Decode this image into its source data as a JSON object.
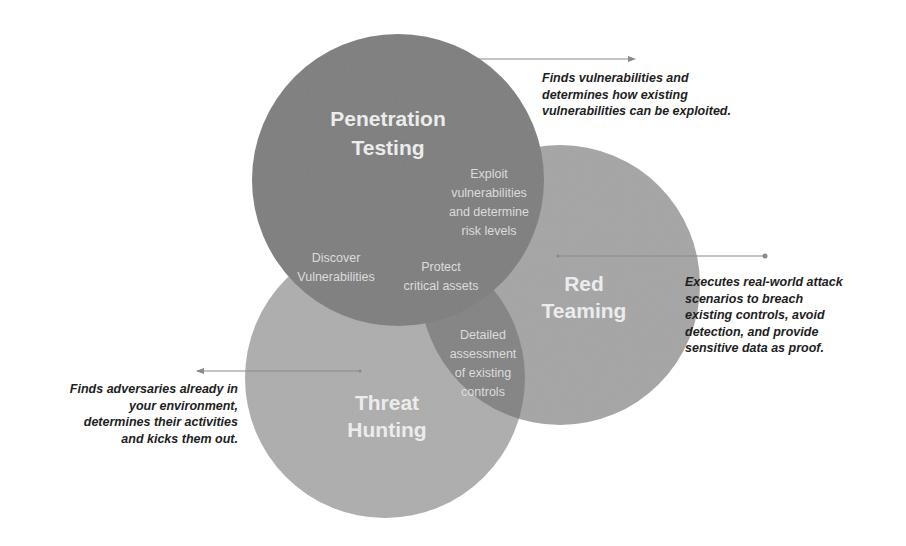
{
  "diagram": {
    "type": "venn",
    "circles": [
      {
        "id": "penetration-testing",
        "title_line1": "Penetration",
        "title_line2": "Testing",
        "color": "#7d7d7d",
        "description": "Finds vulnerabilities and\ndetermines how existing\nvulnerabilities can be exploited."
      },
      {
        "id": "red-teaming",
        "title_line1": "Red",
        "title_line2": "Teaming",
        "color": "#a4a4a4",
        "description": "Executes real-world attack\nscenarios to breach\nexisting controls, avoid\ndetection, and provide\nsensitive data as proof."
      },
      {
        "id": "threat-hunting",
        "title_line1": "Threat",
        "title_line2": "Hunting",
        "color": "#adadad",
        "description": "Finds adversaries already in\nyour environment,\ndetermines their activities\nand kicks them out."
      }
    ],
    "overlaps": {
      "pen_red": {
        "line1": "Exploit",
        "line2": "vulnerabilities",
        "line3": "and determine",
        "line4": "risk levels"
      },
      "pen_threat": {
        "line1": "Discover",
        "line2": "Vulnerabilities"
      },
      "center": {
        "line1": "Protect",
        "line2": "critical assets"
      },
      "red_threat": {
        "line1": "Detailed",
        "line2": "assessment",
        "line3": "of existing",
        "line4": "controls"
      }
    },
    "colors": {
      "overlap_dark": "#7f7f7f",
      "arrow": "#8a8a8a",
      "description_text": "#1e1e1e",
      "title_text": "#ececec"
    }
  }
}
